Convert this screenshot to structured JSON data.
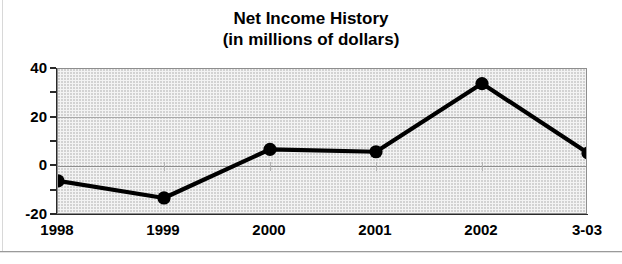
{
  "chart_data": {
    "type": "line",
    "title": "Net Income History",
    "subtitle": "(in millions of dollars)",
    "title_lines": [
      "Net Income History",
      "(in millions of dollars)"
    ],
    "xlabel": "",
    "ylabel": "",
    "categories": [
      "1998",
      "1999",
      "2000",
      "2001",
      "2002",
      "3-03"
    ],
    "values": [
      -6,
      -13,
      7,
      6,
      34,
      5.5
    ],
    "series": [
      {
        "name": "Net Income",
        "values": [
          -6,
          -13,
          7,
          6,
          34,
          5.5
        ]
      }
    ],
    "ylim": [
      -20,
      40
    ],
    "ytick_labels": [
      "40",
      "20",
      "0",
      "-20"
    ],
    "ytick_values": [
      40,
      20,
      0,
      -20
    ],
    "yminor_tick_values": [
      30,
      10,
      -10
    ],
    "grid": true,
    "gridlines_at": [
      20,
      0
    ],
    "legend": "none",
    "marker": "filled-circle",
    "line_color": "#000000",
    "plot_background": "#f3f3f3",
    "axis_color": "#2a2a2a"
  }
}
